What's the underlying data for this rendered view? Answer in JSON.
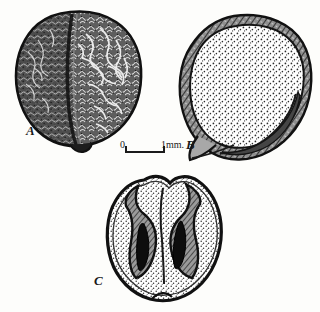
{
  "figure": {
    "kind": "scientific-illustration-plate",
    "background_color": "#fdfdfb",
    "ink_color": "#1b1b1b",
    "panels": [
      {
        "id": "A",
        "label": "A",
        "caption_label": "A",
        "view": "external surface of seed, rugose coat with median cleft",
        "shading": "dense stipple and reticulate wrinkles, dark tone"
      },
      {
        "id": "B",
        "label": "B",
        "caption_label": "B",
        "view": "longitudinal section of seed showing testa and radicle groove",
        "shading": "fine even stipple interior, dark hatched outer coat"
      },
      {
        "id": "C",
        "label": "C",
        "caption_label": "C",
        "view": "transverse section of seed showing two infolded cavities",
        "shading": "fine stipple with dark infolded coat and two black cavities"
      }
    ],
    "scale_bar": {
      "zero_label": "0",
      "unit_label": "1mm.",
      "length_mm": 1
    }
  }
}
